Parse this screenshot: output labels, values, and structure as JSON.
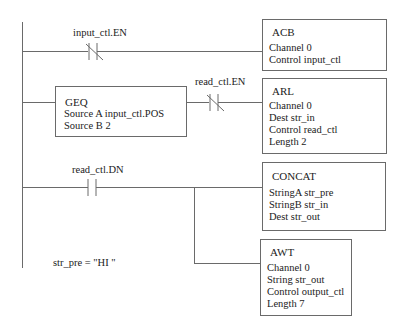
{
  "diagram": {
    "type": "ladder-logic",
    "rungs": [
      {
        "contact": {
          "type": "normally-closed",
          "label": "input_ctl.EN"
        },
        "instruction": {
          "title": "ACB",
          "fields": [
            "Channel 0",
            "Control input_ctl"
          ]
        }
      },
      {
        "condition": {
          "title": "GEQ",
          "fields": [
            "Source A input_ctl.POS",
            "Source B 2"
          ]
        },
        "contact": {
          "type": "normally-closed",
          "label": "read_ctl.EN"
        },
        "instruction": {
          "title": "ARL",
          "fields": [
            "Channel 0",
            "Dest str_in",
            "Control read_ctl",
            "Length 2"
          ]
        }
      },
      {
        "contact": {
          "type": "normally-open",
          "label": "read_ctl.DN"
        },
        "instruction": {
          "title": "CONCAT",
          "fields": [
            "StringA str_pre",
            "StringB str_in",
            "Dest str_out"
          ]
        },
        "branch_instruction": {
          "title": "AWT",
          "fields": [
            "Channel 0",
            "String str_out",
            "Control output_ctl",
            "Length 7"
          ]
        }
      }
    ],
    "note": "str_pre = \"HI \""
  }
}
